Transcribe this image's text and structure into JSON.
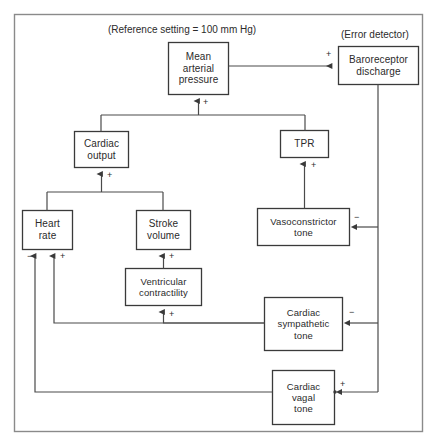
{
  "diagram": {
    "title_note": "(Reference setting  =  100 mm Hg)",
    "error_detector_note": "(Error detector)",
    "frame_color": "#8a8a8a",
    "box_color": "#3a3a3a",
    "line_color": "#4a4a4a",
    "text_color": "#2b2b2b",
    "background": "#ffffff",
    "nodes": [
      {
        "id": "map",
        "label_line1": "Mean",
        "label_line2": "arterial",
        "label_line3": "pressure",
        "x": 168,
        "y": 42,
        "w": 60,
        "h": 52
      },
      {
        "id": "baroreceptor",
        "label_line1": "Baroreceptor",
        "label_line2": "discharge",
        "label_line3": "",
        "x": 338,
        "y": 46,
        "w": 80,
        "h": 38
      },
      {
        "id": "cardiac_output",
        "label_line1": "Cardiac",
        "label_line2": "output",
        "label_line3": "",
        "x": 74,
        "y": 131,
        "w": 54,
        "h": 36
      },
      {
        "id": "tpr",
        "label_line1": "TPR",
        "label_line2": "",
        "label_line3": "",
        "x": 280,
        "y": 130,
        "w": 48,
        "h": 27
      },
      {
        "id": "heart_rate",
        "label_line1": "Heart",
        "label_line2": "rate",
        "label_line3": "",
        "x": 22,
        "y": 210,
        "w": 50,
        "h": 39
      },
      {
        "id": "stroke_volume",
        "label_line1": "Stroke",
        "label_line2": "volume",
        "label_line3": "",
        "x": 136,
        "y": 210,
        "w": 54,
        "h": 39
      },
      {
        "id": "vasoconstrictor",
        "label_line1": "Vasoconstrictor",
        "label_line2": "tone",
        "label_line3": "",
        "x": 257,
        "y": 208,
        "w": 92,
        "h": 37
      },
      {
        "id": "ventricular",
        "label_line1": "Ventricular",
        "label_line2": "contractility",
        "label_line3": "",
        "x": 125,
        "y": 268,
        "w": 76,
        "h": 37
      },
      {
        "id": "sympathetic",
        "label_line1": "Cardiac",
        "label_line2": "sympathetic",
        "label_line3": "tone",
        "x": 264,
        "y": 297,
        "w": 78,
        "h": 53
      },
      {
        "id": "vagal",
        "label_line1": "Cardiac",
        "label_line2": "vagal",
        "label_line3": "tone",
        "x": 272,
        "y": 370,
        "w": 62,
        "h": 54
      }
    ],
    "signs": [
      {
        "id": "sign-map-to-baro",
        "text": "+",
        "x": 326,
        "y": 50
      },
      {
        "id": "sign-into-map",
        "text": "+",
        "x": 203,
        "y": 98
      },
      {
        "id": "sign-into-cardiac-output",
        "text": "+",
        "x": 107,
        "y": 171
      },
      {
        "id": "sign-into-tpr",
        "text": "+",
        "x": 311,
        "y": 161
      },
      {
        "id": "sign-into-heart-rate-neg",
        "text": "−",
        "x": 29,
        "y": 253
      },
      {
        "id": "sign-into-heart-rate-pos",
        "text": "+",
        "x": 60,
        "y": 253
      },
      {
        "id": "sign-into-stroke-volume",
        "text": "+",
        "x": 169,
        "y": 253
      },
      {
        "id": "sign-into-vasoconstrictor",
        "text": "−",
        "x": 355,
        "y": 214
      },
      {
        "id": "sign-into-ventricular",
        "text": "+",
        "x": 169,
        "y": 311
      },
      {
        "id": "sign-into-sympathetic",
        "text": "−",
        "x": 350,
        "y": 305
      },
      {
        "id": "sign-into-vagal",
        "text": "+",
        "x": 341,
        "y": 385
      }
    ]
  }
}
